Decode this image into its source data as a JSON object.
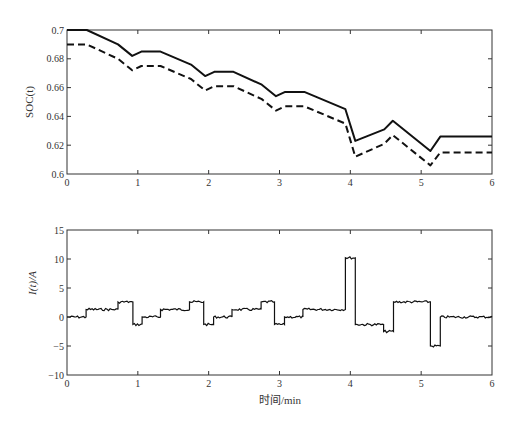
{
  "chart_data": [
    {
      "type": "line",
      "title": "",
      "xlabel": "",
      "ylabel": "SOC(t)",
      "xlim": [
        0,
        6
      ],
      "ylim": [
        0.6,
        0.7
      ],
      "xticks": [
        0,
        1,
        2,
        3,
        4,
        5,
        6
      ],
      "yticks": [
        0.6,
        0.62,
        0.64,
        0.66,
        0.68,
        0.7
      ],
      "ytick_labels": [
        "0.6",
        "0.62",
        "0.64",
        "0.66",
        "0.68",
        "0.7"
      ],
      "grid": false,
      "legend": null,
      "series": [
        {
          "name": "solid",
          "style": "solid",
          "x": [
            0,
            0.28,
            0.72,
            0.92,
            1.05,
            1.32,
            1.75,
            1.95,
            2.08,
            2.35,
            2.75,
            2.95,
            3.08,
            3.35,
            3.93,
            4.07,
            4.48,
            4.6,
            5.13,
            5.27,
            6.0
          ],
          "y": [
            0.7,
            0.7,
            0.69,
            0.682,
            0.685,
            0.685,
            0.676,
            0.668,
            0.671,
            0.671,
            0.662,
            0.654,
            0.657,
            0.657,
            0.645,
            0.623,
            0.631,
            0.637,
            0.616,
            0.626,
            0.626
          ]
        },
        {
          "name": "dashed",
          "style": "dashed",
          "x": [
            0,
            0.28,
            0.72,
            0.92,
            1.05,
            1.32,
            1.75,
            1.95,
            2.08,
            2.35,
            2.75,
            2.95,
            3.08,
            3.35,
            3.93,
            4.07,
            4.48,
            4.6,
            5.13,
            5.27,
            6.0
          ],
          "y": [
            0.69,
            0.69,
            0.68,
            0.672,
            0.675,
            0.675,
            0.666,
            0.658,
            0.661,
            0.661,
            0.652,
            0.644,
            0.647,
            0.647,
            0.635,
            0.612,
            0.621,
            0.627,
            0.606,
            0.615,
            0.615
          ]
        }
      ]
    },
    {
      "type": "line",
      "title": "",
      "xlabel": "时间/min",
      "ylabel": "I(t)/A",
      "xlim": [
        0,
        6
      ],
      "ylim": [
        -10,
        15
      ],
      "xticks": [
        0,
        1,
        2,
        3,
        4,
        5,
        6
      ],
      "yticks": [
        -10,
        -5,
        0,
        5,
        10,
        15
      ],
      "ytick_labels": [
        "−10",
        "−5",
        "0",
        "5",
        "10",
        "15"
      ],
      "grid": false,
      "legend": null,
      "series": [
        {
          "name": "current",
          "style": "step",
          "segments": [
            {
              "x0": 0.0,
              "x1": 0.27,
              "y": 0.0
            },
            {
              "x0": 0.27,
              "x1": 0.72,
              "y": 1.3
            },
            {
              "x0": 0.72,
              "x1": 0.93,
              "y": 2.6
            },
            {
              "x0": 0.93,
              "x1": 1.06,
              "y": -1.3
            },
            {
              "x0": 1.06,
              "x1": 1.32,
              "y": 0.0
            },
            {
              "x0": 1.32,
              "x1": 1.73,
              "y": 1.3
            },
            {
              "x0": 1.73,
              "x1": 1.93,
              "y": 2.6
            },
            {
              "x0": 1.93,
              "x1": 2.07,
              "y": -1.3
            },
            {
              "x0": 2.07,
              "x1": 2.33,
              "y": 0.0
            },
            {
              "x0": 2.33,
              "x1": 2.74,
              "y": 1.3
            },
            {
              "x0": 2.74,
              "x1": 2.93,
              "y": 2.6
            },
            {
              "x0": 2.93,
              "x1": 3.07,
              "y": -1.3
            },
            {
              "x0": 3.07,
              "x1": 3.33,
              "y": 0.0
            },
            {
              "x0": 3.33,
              "x1": 3.93,
              "y": 1.3
            },
            {
              "x0": 3.93,
              "x1": 4.07,
              "y": 10.2
            },
            {
              "x0": 4.07,
              "x1": 4.47,
              "y": -1.3
            },
            {
              "x0": 4.47,
              "x1": 4.61,
              "y": -2.5
            },
            {
              "x0": 4.61,
              "x1": 5.13,
              "y": 2.6
            },
            {
              "x0": 5.13,
              "x1": 5.27,
              "y": -5.0
            },
            {
              "x0": 5.27,
              "x1": 6.0,
              "y": 0.0
            }
          ]
        }
      ]
    }
  ]
}
